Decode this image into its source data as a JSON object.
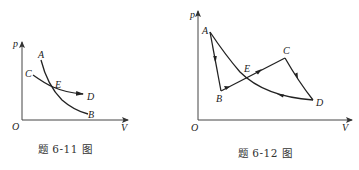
{
  "figures": [
    {
      "id": "fig-6-11",
      "caption": "题  6-11 图",
      "axes": {
        "y_label": "p",
        "x_label": "V",
        "origin_label": "O"
      },
      "points": {
        "A": "A",
        "B": "B",
        "C": "C",
        "D": "D",
        "E": "E"
      },
      "curves": [
        {
          "name": "curve-AB",
          "from": "A",
          "to": "B",
          "passes_through": "E",
          "arrow": false
        },
        {
          "name": "curve-CD",
          "from": "C",
          "to": "D",
          "passes_through": "E",
          "arrow": true
        }
      ]
    },
    {
      "id": "fig-6-12",
      "caption": "题  6-12 图",
      "axes": {
        "y_label": "p",
        "x_label": "V",
        "origin_label": "O"
      },
      "points": {
        "A": "A",
        "B": "B",
        "C": "C",
        "D": "D",
        "E": "E"
      },
      "cycle": [
        "A",
        "B",
        "C",
        "D",
        "A"
      ],
      "segments": [
        {
          "name": "segment-AB",
          "from": "A",
          "to": "B",
          "type": "straight",
          "arrow": "down"
        },
        {
          "name": "segment-BC",
          "from": "B",
          "to": "C",
          "type": "straight",
          "passes_through": "E",
          "arrow": "up-right"
        },
        {
          "name": "segment-CD",
          "from": "C",
          "to": "D",
          "type": "curve",
          "arrow": "down-right"
        },
        {
          "name": "segment-DA",
          "from": "D",
          "to": "A",
          "type": "curve",
          "passes_through": "E",
          "arrow": "left"
        }
      ]
    }
  ]
}
